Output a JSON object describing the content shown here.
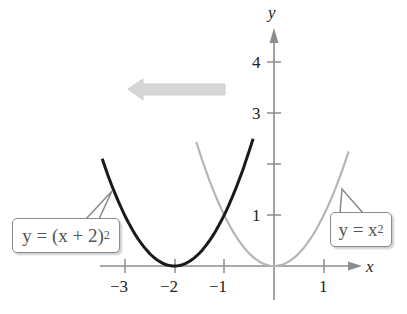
{
  "chart_data": {
    "type": "line",
    "title": "",
    "xlabel": "x",
    "ylabel": "y",
    "xlim": [
      -3.5,
      1.9
    ],
    "ylim": [
      -0.6,
      4.8
    ],
    "x_ticks": [
      -3,
      -2,
      -1,
      1
    ],
    "x_tick_labels": [
      "−3",
      "−2",
      "−1",
      "1"
    ],
    "y_ticks": [
      1,
      2,
      3,
      4
    ],
    "y_tick_labels": [
      "1",
      "",
      "3",
      "4"
    ],
    "grid": false,
    "series": [
      {
        "name": "y = (x + 2)^2",
        "function": "(x+2)^2",
        "x_range": [
          -3.45,
          -0.42
        ],
        "color": "#1a1a1a",
        "vertex": [
          -2,
          0
        ]
      },
      {
        "name": "y = x^2",
        "function": "x^2",
        "x_range": [
          -1.56,
          1.5
        ],
        "color": "#b5b5b5",
        "vertex": [
          0,
          0
        ]
      }
    ],
    "annotations": [
      {
        "type": "arrow",
        "direction": "left",
        "meaning": "horizontal shift left 2 units",
        "color": "#d6d6d6"
      },
      {
        "type": "callout",
        "text": "y = (x + 2)^2",
        "points_to": [
          -3.2,
          1.5
        ]
      },
      {
        "type": "callout",
        "text": "y = x^2",
        "points_to": [
          1.3,
          1.6
        ]
      }
    ]
  },
  "labels": {
    "x_axis": "x",
    "y_axis": "y",
    "x_ticks": [
      "−3",
      "−2",
      "−1",
      "1"
    ],
    "y_ticks": [
      "1",
      "3",
      "4"
    ],
    "callout_left": {
      "prefix": "y = (x + 2)",
      "exp": "2"
    },
    "callout_right": {
      "prefix": "y = x",
      "exp": "2"
    }
  },
  "colors": {
    "axis": "#8c8c8c",
    "shifted_curve": "#1a1a1a",
    "base_curve": "#b5b5b5",
    "arrow": "#d6d6d6"
  }
}
